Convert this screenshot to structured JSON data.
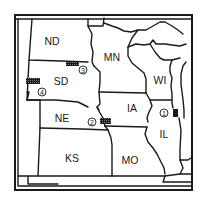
{
  "map": {
    "region": "Upper Midwest / Great Plains, United States",
    "colors": {
      "ink": "#1a1a1a",
      "background": "#ffffff"
    },
    "states": [
      {
        "abbr": "ND",
        "x": 52,
        "y": 42
      },
      {
        "abbr": "MN",
        "x": 112,
        "y": 58
      },
      {
        "abbr": "SD",
        "x": 61,
        "y": 82
      },
      {
        "abbr": "WI",
        "x": 160,
        "y": 81
      },
      {
        "abbr": "NE",
        "x": 62,
        "y": 119
      },
      {
        "abbr": "IA",
        "x": 132,
        "y": 109
      },
      {
        "abbr": "IL",
        "x": 164,
        "y": 135
      },
      {
        "abbr": "KS",
        "x": 72,
        "y": 159
      },
      {
        "abbr": "MO",
        "x": 130,
        "y": 161
      }
    ],
    "markers": [
      {
        "number": "1",
        "symbol": "①",
        "cx": 164,
        "cy": 113,
        "rect": {
          "x": 173,
          "y": 110,
          "w": 5,
          "h": 7,
          "style": "solid"
        }
      },
      {
        "number": "2",
        "symbol": "②",
        "cx": 92,
        "cy": 122,
        "rect": {
          "x": 100,
          "y": 118,
          "w": 11,
          "h": 6,
          "style": "hatched"
        }
      },
      {
        "number": "3",
        "symbol": "③",
        "cx": 83,
        "cy": 70,
        "rect": {
          "x": 66,
          "y": 62,
          "w": 12,
          "h": 4,
          "style": "hatched"
        }
      },
      {
        "number": "4",
        "symbol": "④",
        "cx": 42,
        "cy": 92,
        "rect": {
          "x": 26,
          "y": 78,
          "w": 14,
          "h": 6,
          "style": "hatched"
        }
      }
    ]
  }
}
